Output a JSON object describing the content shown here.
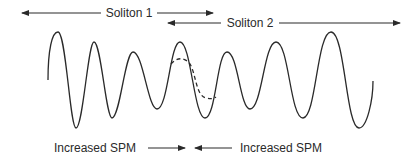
{
  "diagram": {
    "type": "soliton-interaction-illustration",
    "top_labels": {
      "soliton1": "Soliton 1",
      "soliton2": "Soliton 2"
    },
    "bottom_labels": {
      "left": "Increased SPM",
      "right": "Increased SPM"
    },
    "colors": {
      "line": "#2a2a2a",
      "background": "#ffffff"
    },
    "wave": {
      "description": "Oscillating waveform with amplitude decreasing toward the center and increasing toward the edges; a dashed curve overlays the central region indicating reduced amplitude",
      "peaks_approx": [
        {
          "x": 58,
          "y": 32
        },
        {
          "x": 94,
          "y": 42
        },
        {
          "x": 133,
          "y": 52
        },
        {
          "x": 180,
          "y": 42
        },
        {
          "x": 227,
          "y": 52
        },
        {
          "x": 276,
          "y": 42
        },
        {
          "x": 331,
          "y": 32
        }
      ]
    }
  }
}
